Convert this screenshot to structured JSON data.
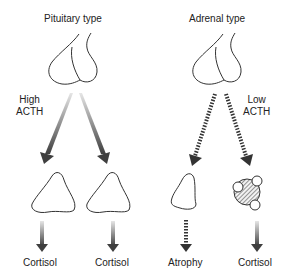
{
  "panels": {
    "pituitary": {
      "title": "Pituitary type",
      "acth_label_line1": "High",
      "acth_label_line2": "ACTH",
      "outputs": [
        "Cortisol",
        "Cortisol"
      ]
    },
    "adrenal": {
      "title": "Adrenal type",
      "acth_label_line1": "Low",
      "acth_label_line2": "ACTH",
      "outputs": [
        "Atrophy",
        "Cortisol"
      ]
    }
  },
  "colors": {
    "outline": "#333333",
    "arrow_dark": "#444444",
    "arrow_light": "#dddddd"
  }
}
